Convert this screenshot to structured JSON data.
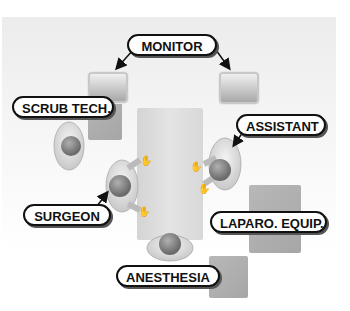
{
  "diagram": {
    "labels": {
      "monitor": "MONITOR",
      "scrub_tech": "SCRUB TECH.",
      "assistant": "ASSISTANT",
      "surgeon": "SURGEON",
      "laparo_equip": "LAPARO. EQUIP.",
      "anesthesia": "ANESTHESIA"
    },
    "elements": [
      {
        "id": "monitor-left",
        "type": "monitor"
      },
      {
        "id": "monitor-right",
        "type": "monitor"
      },
      {
        "id": "operating-table",
        "type": "table"
      },
      {
        "id": "scrub-tech",
        "type": "person"
      },
      {
        "id": "surgeon",
        "type": "person"
      },
      {
        "id": "assistant",
        "type": "person"
      },
      {
        "id": "anesthesia",
        "type": "person"
      },
      {
        "id": "instrument-stand",
        "type": "equipment"
      },
      {
        "id": "laparo-equip-cart",
        "type": "equipment"
      },
      {
        "id": "anesthesia-cart",
        "type": "equipment"
      }
    ],
    "colors": {
      "label_border": "#111111",
      "equipment": "#adadad",
      "table": "#dcdcdc",
      "person_head": "#8a8a8a"
    }
  }
}
